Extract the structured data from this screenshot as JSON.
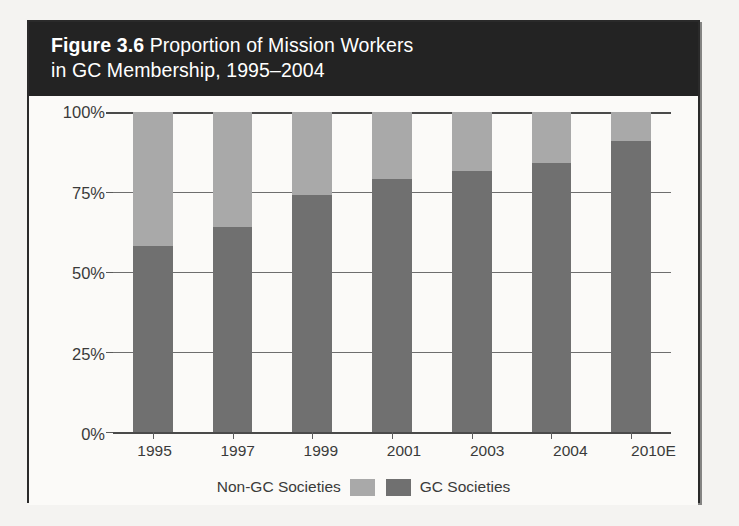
{
  "figure": {
    "label": "Figure 3.6",
    "title_line1_rest": " Proportion of Mission Workers",
    "title_line2": "in GC Membership, 1995–2004",
    "banner_color": "#232323",
    "frame_color": "#2a2a2a",
    "background": "#fbfaf8"
  },
  "chart_data": {
    "type": "bar",
    "stacked": true,
    "title": "Figure 3.6 Proportion of Mission Workers in GC Membership, 1995–2004",
    "xlabel": "",
    "ylabel": "",
    "categories": [
      "1995",
      "1997",
      "1999",
      "2001",
      "2003",
      "2004",
      "2010E"
    ],
    "series": [
      {
        "name": "GC Societies",
        "color": "#707070",
        "values": [
          58,
          64,
          74,
          79,
          81.5,
          84,
          91
        ]
      },
      {
        "name": "Non-GC Societies",
        "color": "#a9a9a9",
        "values": [
          42,
          36,
          26,
          21,
          18.5,
          16,
          9
        ]
      }
    ],
    "ylim": [
      0,
      100
    ],
    "yticks": [
      0,
      25,
      50,
      75,
      100
    ],
    "ytick_labels": [
      "0%",
      "25%",
      "50%",
      "75%",
      "100%"
    ],
    "grid": true,
    "grid_axis": "y",
    "legend_position": "bottom",
    "legend_order": [
      "Non-GC Societies",
      "GC Societies"
    ],
    "value_unit": "percent"
  }
}
